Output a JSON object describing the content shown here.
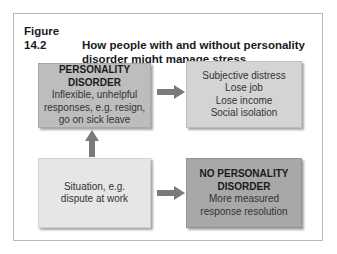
{
  "figure": {
    "number": "Figure 14.2",
    "title_line1": "How people with and without personality",
    "title_line2": "disorder might manage stress"
  },
  "boxes": {
    "personality_disorder": {
      "heading_line1": "PERSONALITY",
      "heading_line2": "DISORDER",
      "lines": [
        "Inflexible, unhelpful",
        "responses, e.g. resign,",
        "go on sick leave"
      ]
    },
    "consequences": {
      "lines": [
        "Subjective distress",
        "Lose job",
        "Lose income",
        "Social isolation"
      ]
    },
    "situation": {
      "lines": [
        "Situation, e.g.",
        "dispute at work"
      ]
    },
    "no_personality_disorder": {
      "heading_line1": "NO PERSONALITY",
      "heading_line2": "DISORDER",
      "lines": [
        "More measured",
        "response resolution"
      ]
    }
  },
  "colors": {
    "arrow": "#7a7a7a",
    "pd_box": "#bdbdbd",
    "consequences_box": "#d4d4d4",
    "situation_box": "#e6e6e6",
    "npd_box": "#a8a8a8"
  }
}
